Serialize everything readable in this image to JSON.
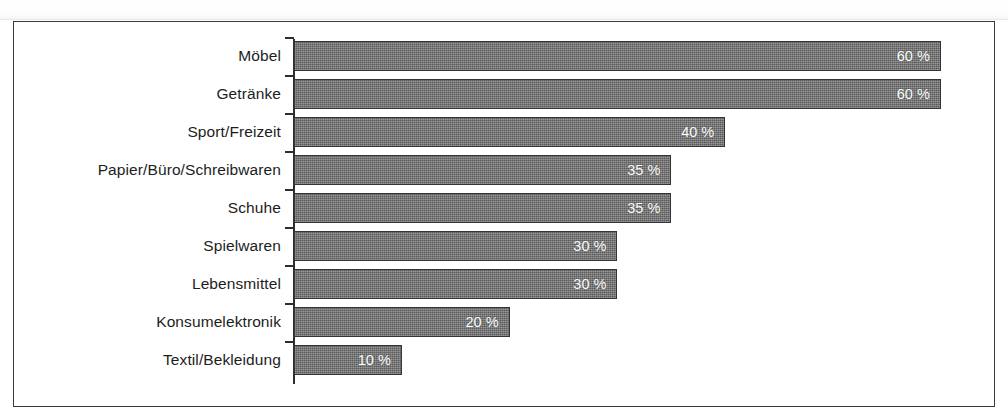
{
  "chart_data": {
    "type": "bar",
    "orientation": "horizontal",
    "title": "",
    "subtitle": "",
    "xlabel": "",
    "ylabel": "",
    "xlim": [
      0,
      60
    ],
    "grid": false,
    "legend": null,
    "value_suffix": "%",
    "categories": [
      "Möbel",
      "Getränke",
      "Sport/Freizeit",
      "Papier/Büro/Schreibwaren",
      "Schuhe",
      "Spielwaren",
      "Lebensmittel",
      "Konsumelektronik",
      "Textil/Bekleidung"
    ],
    "values": [
      60,
      60,
      40,
      35,
      35,
      30,
      30,
      20,
      10
    ],
    "value_labels": [
      "60 %",
      "60 %",
      "40 %",
      "35 %",
      "35 %",
      "30 %",
      "30 %",
      "20 %",
      "10 %"
    ],
    "colors": {
      "bar_fill": "#6f6f6f",
      "bar_border": "#353535",
      "value_text": "#ffffff",
      "category_text": "#1d1d1d",
      "frame_border": "#3a3a3a",
      "axis_line": "#2e2e2e",
      "background": "#ffffff"
    }
  },
  "rows": [
    {
      "label": "Möbel",
      "value": 60,
      "value_label": "60 %"
    },
    {
      "label": "Getränke",
      "value": 60,
      "value_label": "60 %"
    },
    {
      "label": "Sport/Freizeit",
      "value": 40,
      "value_label": "40 %"
    },
    {
      "label": "Papier/Büro/Schreibwaren",
      "value": 35,
      "value_label": "35 %"
    },
    {
      "label": "Schuhe",
      "value": 35,
      "value_label": "35 %"
    },
    {
      "label": "Spielwaren",
      "value": 30,
      "value_label": "30 %"
    },
    {
      "label": "Lebensmittel",
      "value": 30,
      "value_label": "30 %"
    },
    {
      "label": "Konsumelektronik",
      "value": 20,
      "value_label": "20 %"
    },
    {
      "label": "Textil/Bekleidung",
      "value": 10,
      "value_label": "10 %"
    }
  ],
  "geometry": {
    "row_pitch_px": 38,
    "bar_height_px": 30,
    "first_row_top_px": 19,
    "px_per_percent": 10.78
  }
}
